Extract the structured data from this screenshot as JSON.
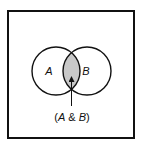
{
  "diagram": {
    "type": "venn",
    "sets": [
      {
        "label": "A",
        "cx": 56,
        "cy": 71,
        "r": 24
      },
      {
        "label": "B",
        "cx": 87,
        "cy": 71,
        "r": 24
      }
    ],
    "intersection": {
      "label": "(A & B)",
      "label_parts": [
        "(",
        "A",
        " & ",
        "B",
        ")"
      ],
      "fill": "#c8c8c8"
    },
    "colors": {
      "stroke": "#111111",
      "background": "#ffffff"
    }
  }
}
